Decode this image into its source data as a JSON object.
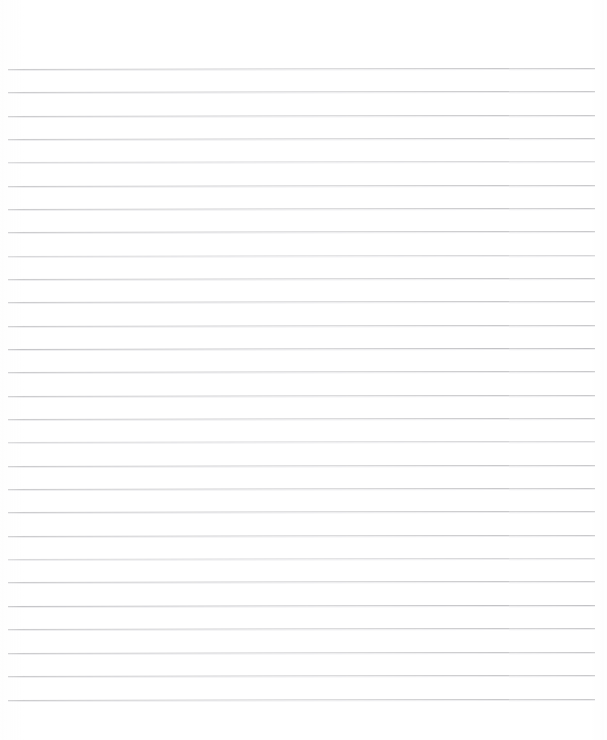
{
  "document": {
    "kind": "lined-paper-scan",
    "title": "",
    "visible_text": "",
    "page_width": 607,
    "page_height": 740,
    "background_color": "#ffffff",
    "rule_color": "#c9c9cb",
    "rule_thickness_px": 1,
    "rule_left_x": 8,
    "rule_right_x": 595,
    "rule_first_y": 69,
    "rule_spacing_px": 23.35,
    "rule_count": 28,
    "top_margin_px": 69,
    "bottom_margin_px": 40,
    "skew_degrees": -0.1,
    "rules": [
      {
        "index": 1,
        "y": 69,
        "weight": "normal"
      },
      {
        "index": 2,
        "y": 92,
        "weight": "normal"
      },
      {
        "index": 3,
        "y": 116,
        "weight": "normal"
      },
      {
        "index": 4,
        "y": 139,
        "weight": "normal"
      },
      {
        "index": 5,
        "y": 162,
        "weight": "faint"
      },
      {
        "index": 6,
        "y": 186,
        "weight": "normal"
      },
      {
        "index": 7,
        "y": 209,
        "weight": "normal"
      },
      {
        "index": 8,
        "y": 232,
        "weight": "normal"
      },
      {
        "index": 9,
        "y": 256,
        "weight": "faint"
      },
      {
        "index": 10,
        "y": 279,
        "weight": "normal"
      },
      {
        "index": 11,
        "y": 302,
        "weight": "normal"
      },
      {
        "index": 12,
        "y": 326,
        "weight": "normal"
      },
      {
        "index": 13,
        "y": 349,
        "weight": "strong"
      },
      {
        "index": 14,
        "y": 372,
        "weight": "normal"
      },
      {
        "index": 15,
        "y": 396,
        "weight": "normal"
      },
      {
        "index": 16,
        "y": 419,
        "weight": "normal"
      },
      {
        "index": 17,
        "y": 442,
        "weight": "faint"
      },
      {
        "index": 18,
        "y": 466,
        "weight": "normal"
      },
      {
        "index": 19,
        "y": 489,
        "weight": "normal"
      },
      {
        "index": 20,
        "y": 512,
        "weight": "normal"
      },
      {
        "index": 21,
        "y": 536,
        "weight": "normal"
      },
      {
        "index": 22,
        "y": 559,
        "weight": "faint"
      },
      {
        "index": 23,
        "y": 582,
        "weight": "normal"
      },
      {
        "index": 24,
        "y": 606,
        "weight": "strong"
      },
      {
        "index": 25,
        "y": 629,
        "weight": "normal"
      },
      {
        "index": 26,
        "y": 653,
        "weight": "normal"
      },
      {
        "index": 27,
        "y": 676,
        "weight": "normal"
      },
      {
        "index": 28,
        "y": 700,
        "weight": "normal"
      }
    ]
  }
}
